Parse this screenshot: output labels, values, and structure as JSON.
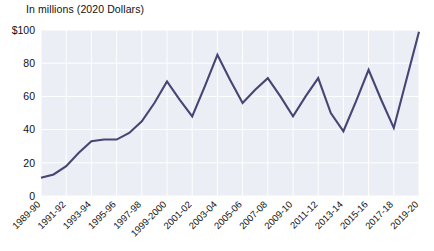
{
  "chart_data": {
    "type": "line",
    "title": "In millions (2020 Dollars)",
    "subtitle": "",
    "xlabel": "",
    "ylabel": "In millions (2020 Dollars)",
    "ylim": [
      0,
      100
    ],
    "yticks": [
      0,
      20,
      40,
      60,
      80,
      100
    ],
    "ytick_labels": [
      "0",
      "20",
      "40",
      "60",
      "80",
      "$100"
    ],
    "grid": true,
    "legend": false,
    "legend_position": "none",
    "series_color": "#464573",
    "plot_background": "#eceef5",
    "categories": [
      "1989-90",
      "1990-91",
      "1991-92",
      "1992-93",
      "1993-94",
      "1994-95",
      "1995-96",
      "1996-97",
      "1997-98",
      "1998-99",
      "1999-2000",
      "2000-01",
      "2001-02",
      "2002-03",
      "2003-04",
      "2004-05",
      "2005-06",
      "2006-07",
      "2007-08",
      "2008-09",
      "2009-10",
      "2010-11",
      "2011-12",
      "2012-13",
      "2013-14",
      "2014-15",
      "2015-16",
      "2016-17",
      "2017-18",
      "2018-19",
      "2019-20"
    ],
    "xtick_labels": [
      "1989-90",
      "1991-92",
      "1993-94",
      "1995-96",
      "1997-98",
      "1999-2000",
      "2001-02",
      "2003-04",
      "2005-06",
      "2007-08",
      "2009-10",
      "2011-12",
      "2013-14",
      "2015-16",
      "2017-18",
      "2019-20"
    ],
    "values": [
      11,
      13,
      18,
      26,
      33,
      34,
      34,
      38,
      45,
      56,
      69,
      58,
      48,
      66,
      85,
      70,
      56,
      64,
      71,
      60,
      48,
      60,
      71,
      50,
      39,
      57,
      76,
      58,
      41,
      70,
      99
    ]
  }
}
